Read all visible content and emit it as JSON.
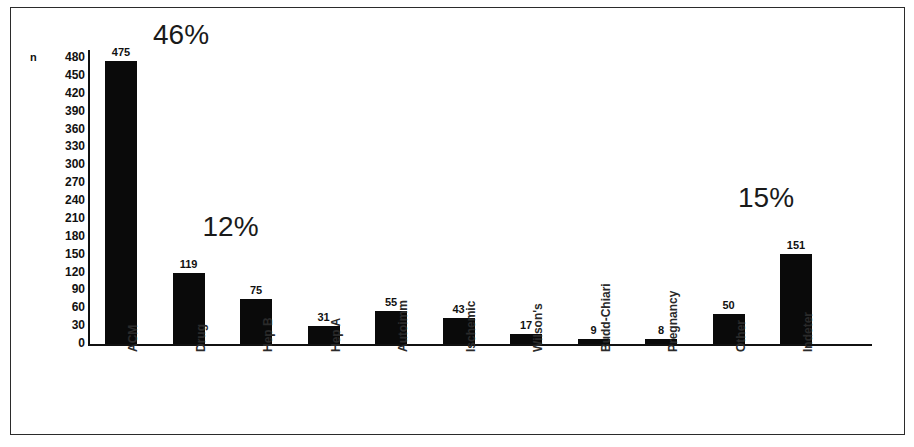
{
  "chart_data": {
    "type": "bar",
    "title": "",
    "xlabel": "",
    "ylabel": "n",
    "ylim": [
      0,
      480
    ],
    "ytick_step": 30,
    "yticks": [
      480,
      450,
      420,
      390,
      360,
      330,
      300,
      270,
      240,
      210,
      180,
      150,
      120,
      90,
      60,
      30,
      0
    ],
    "grid": false,
    "legend": false,
    "bar_color": "#0a0a0a",
    "categories": [
      "ACM",
      "Drug",
      "Hep B",
      "Hep A",
      "Autoimm",
      "Ischemic",
      "Wilson's",
      "Budd-Chiari",
      "Pregnancy",
      "Other",
      "Indeter"
    ],
    "values": [
      475,
      119,
      75,
      31,
      55,
      43,
      17,
      9,
      8,
      50,
      151
    ],
    "annotations": [
      {
        "category": "ACM",
        "text": "46%"
      },
      {
        "category": "Drug",
        "text": "12%"
      },
      {
        "category": "Indeter",
        "text": "15%"
      }
    ]
  }
}
